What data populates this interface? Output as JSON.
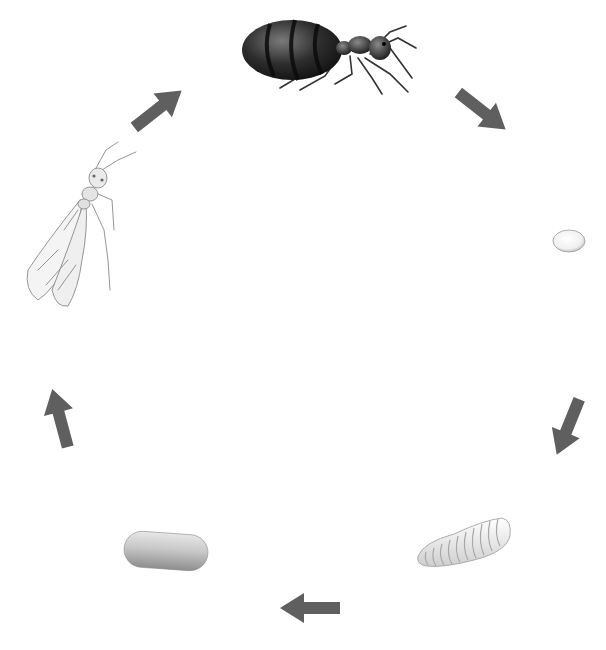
{
  "diagram": {
    "type": "cycle",
    "background": "#ffffff",
    "arrow_color": "#5f5f5f",
    "stages": [
      {
        "id": "queen",
        "label": "adult queen ant",
        "position": "top"
      },
      {
        "id": "egg",
        "label": "egg",
        "position": "right"
      },
      {
        "id": "larva",
        "label": "larva",
        "position": "bottom-right"
      },
      {
        "id": "pupa",
        "label": "pupa",
        "position": "bottom-left"
      },
      {
        "id": "alate",
        "label": "winged adult ant",
        "position": "left"
      }
    ],
    "arrows": [
      {
        "from": "queen",
        "to": "egg"
      },
      {
        "from": "egg",
        "to": "larva"
      },
      {
        "from": "larva",
        "to": "pupa"
      },
      {
        "from": "pupa",
        "to": "alate"
      },
      {
        "from": "alate",
        "to": "queen"
      }
    ]
  }
}
